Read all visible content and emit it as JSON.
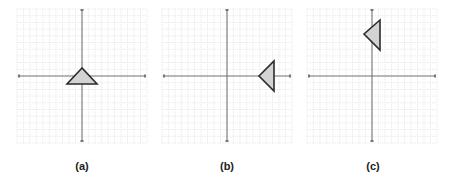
{
  "figure": {
    "grid": {
      "cells": 20,
      "line_color": "#e6e6e6",
      "axis_color": "#777777"
    },
    "triangle_style": {
      "fill": "#d3d3d3",
      "stroke": "#2b2b2b"
    },
    "panels": [
      {
        "label": "(a)",
        "description": "Triangle pointing up, centered on origin, sitting slightly below x-axis",
        "grid_box": [
          17,
          9,
          130,
          134
        ],
        "origin": [
          82,
          76
        ],
        "triangle": [
          [
            82,
            68
          ],
          [
            67,
            84
          ],
          [
            97,
            84
          ]
        ]
      },
      {
        "label": "(b)",
        "description": "Triangle pointing left, on the positive x-axis",
        "grid_box": [
          162,
          9,
          130,
          134
        ],
        "origin": [
          227,
          76
        ],
        "triangle": [
          [
            259,
            76
          ],
          [
            274,
            61
          ],
          [
            274,
            91
          ]
        ]
      },
      {
        "label": "(c)",
        "description": "Triangle pointing left, on the positive y-axis",
        "grid_box": [
          307,
          9,
          130,
          134
        ],
        "origin": [
          372,
          76
        ],
        "triangle": [
          [
            380,
            20
          ],
          [
            364,
            34
          ],
          [
            380,
            50
          ]
        ]
      }
    ]
  }
}
